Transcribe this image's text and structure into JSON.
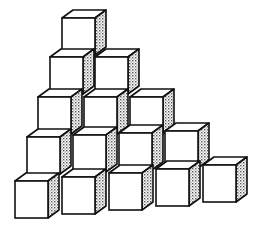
{
  "figure": {
    "rows": [
      {
        "row": 1,
        "cube_count": 1
      },
      {
        "row": 2,
        "cube_count": 2
      },
      {
        "row": 3,
        "cube_count": 3
      },
      {
        "row": 4,
        "cube_count": 4
      },
      {
        "row": 5,
        "cube_count": 5
      }
    ],
    "total_cubes": 15,
    "colors": {
      "background": "#ffffff",
      "face": "#ffffff",
      "stroke": "#111111",
      "shade": "#b8b8b8"
    }
  }
}
